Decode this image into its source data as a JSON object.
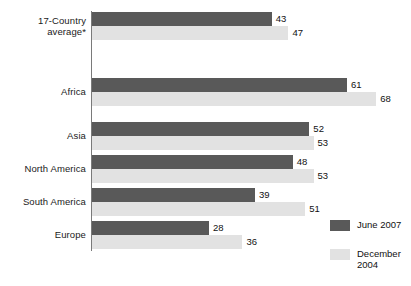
{
  "chart_data": {
    "type": "bar",
    "orientation": "horizontal",
    "title": "",
    "xlabel": "",
    "ylabel": "",
    "xlim": [
      0,
      76
    ],
    "grid": false,
    "legend_position": "bottom-right",
    "categories": [
      "17-Country average*",
      "Africa",
      "Asia",
      "North America",
      "South America",
      "Europe"
    ],
    "series": [
      {
        "name": "June 2007",
        "color": "#595959",
        "values": [
          43,
          61,
          52,
          48,
          39,
          28
        ]
      },
      {
        "name": "December 2004",
        "color": "#e2e2e2",
        "values": [
          47,
          68,
          53,
          53,
          51,
          36
        ]
      }
    ]
  },
  "axis": {
    "category_labels": [
      "17-Country\naverage*",
      "Africa",
      "Asia",
      "North America",
      "South America",
      "Europe"
    ]
  },
  "legend": {
    "items": [
      {
        "label": "June 2007",
        "color": "#595959"
      },
      {
        "label": "December\n2004",
        "color": "#e2e2e2"
      }
    ]
  }
}
